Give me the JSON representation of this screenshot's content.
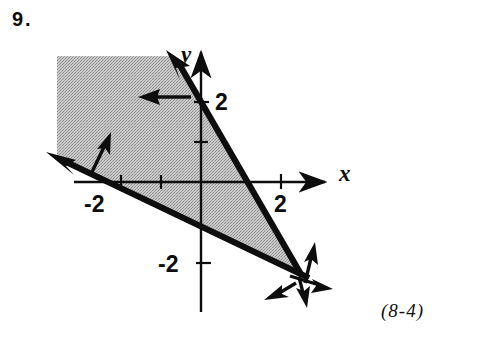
{
  "problem": {
    "number": "9.",
    "section_reference": "(8-4)"
  },
  "figure": {
    "type": "system-of-linear-inequalities-graph",
    "axes": {
      "x_label": "x",
      "y_label": "y",
      "x_ticks": [
        {
          "value": -2,
          "label": "-2"
        },
        {
          "value": -1,
          "label": ""
        },
        {
          "value": 1,
          "label": ""
        },
        {
          "value": 2,
          "label": "2"
        }
      ],
      "y_ticks": [
        {
          "value": 2,
          "label": "2"
        },
        {
          "value": 1,
          "label": ""
        },
        {
          "value": -2,
          "label": "-2"
        }
      ],
      "x_range": [
        -3.2,
        3.2
      ],
      "y_range": [
        -3.2,
        3.2
      ],
      "origin_px": {
        "x": 201,
        "y": 182
      },
      "unit_px": 40
    },
    "boundary_lines": [
      {
        "name": "steep-boundary-line",
        "style": "solid",
        "description": "steep negatively sloped line through roughly (-0.7, 3.1) and (2.4, -2.2)",
        "shading_direction": "left"
      },
      {
        "name": "shallow-boundary-line",
        "style": "solid",
        "description": "shallow negatively sloped line through roughly (-3.2, 0.4) and (2.5, -2.3)",
        "shading_direction": "up"
      }
    ],
    "shaded_region": {
      "name": "solution-region",
      "fill": "#b4b4b4",
      "description": "wedge region left of the steep line and above the shallow line, clipped to the upper-left of the plot"
    },
    "direction_arrows": [
      {
        "name": "steep-line-upper-arrow",
        "points": "left"
      },
      {
        "name": "shallow-line-left-arrow",
        "points": "up"
      },
      {
        "name": "intersection-arrow-up",
        "points": "up"
      },
      {
        "name": "intersection-arrow-right",
        "points": "right"
      },
      {
        "name": "intersection-arrow-down-left",
        "points": "down-left"
      },
      {
        "name": "intersection-arrow-down",
        "points": "down"
      }
    ]
  },
  "colors": {
    "ink": "#0d0d0d",
    "shade": "#b4b4b4",
    "paper": "#ffffff"
  }
}
